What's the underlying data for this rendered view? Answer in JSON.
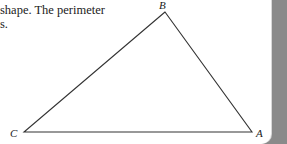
{
  "text": {
    "line1": "shape. The perimeter",
    "line2": "s."
  },
  "figure": {
    "type": "triangle",
    "vertices": [
      {
        "label": "B",
        "x": 165,
        "y": 12
      },
      {
        "label": "C",
        "x": 24,
        "y": 132
      },
      {
        "label": "A",
        "x": 252,
        "y": 132
      }
    ],
    "stroke_color": "#333333"
  },
  "colors": {
    "background": "#ffffff",
    "side_panel": "#8a8a8a"
  }
}
